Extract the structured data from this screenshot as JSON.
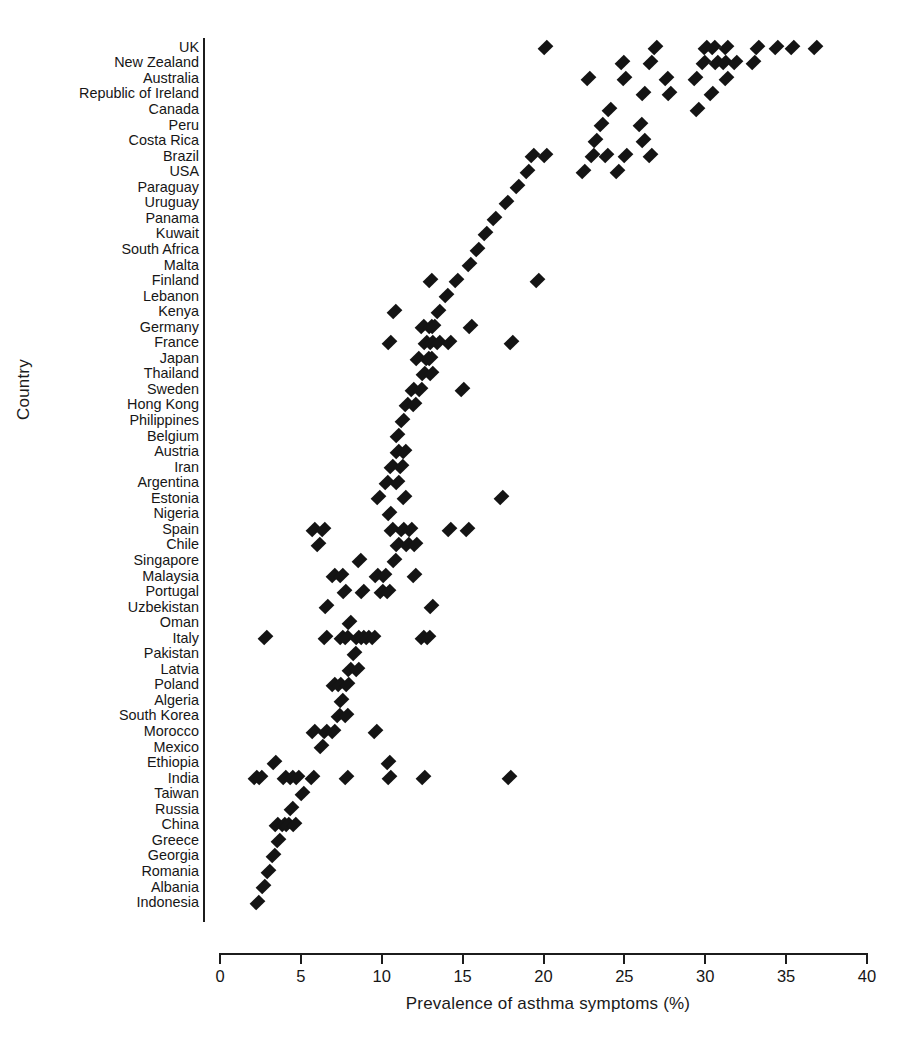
{
  "chart_data": {
    "type": "scatter",
    "title": "",
    "xlabel": "Prevalence of asthma symptoms (%)",
    "ylabel": "Country",
    "xlim": [
      0,
      40
    ],
    "xticks": [
      0,
      5,
      10,
      15,
      20,
      25,
      30,
      35,
      40
    ],
    "grid": false,
    "legend": null,
    "orientation": "horizontal-categorical",
    "marker": "diamond",
    "marker_color": "#141414",
    "categories": [
      "UK",
      "New Zealand",
      "Australia",
      "Republic of Ireland",
      "Canada",
      "Peru",
      "Costa Rica",
      "Brazil",
      "USA",
      "Paraguay",
      "Uruguay",
      "Panama",
      "Kuwait",
      "South Africa",
      "Malta",
      "Finland",
      "Lebanon",
      "Kenya",
      "Germany",
      "France",
      "Japan",
      "Thailand",
      "Sweden",
      "Hong Kong",
      "Philippines",
      "Belgium",
      "Austria",
      "Iran",
      "Argentina",
      "Estonia",
      "Nigeria",
      "Spain",
      "Chile",
      "Singapore",
      "Malaysia",
      "Portugal",
      "Uzbekistan",
      "Oman",
      "Italy",
      "Pakistan",
      "Latvia",
      "Poland",
      "Algeria",
      "South Korea",
      "Morocco",
      "Mexico",
      "Ethiopia",
      "India",
      "Taiwan",
      "Russia",
      "China",
      "Greece",
      "Georgia",
      "Romania",
      "Albania",
      "Indonesia"
    ],
    "series": [
      {
        "name": "Prevalence of asthma symptoms (%)",
        "points_by_category": {
          "UK": [
            20.1,
            26.9,
            30.0,
            30.5,
            31.3,
            33.2,
            34.4,
            35.4,
            36.8
          ],
          "New Zealand": [
            24.9,
            26.6,
            29.9,
            30.7,
            31.2,
            31.9,
            33.0
          ],
          "Australia": [
            22.8,
            25.0,
            27.6,
            29.4,
            31.3
          ],
          "Republic of Ireland": [
            26.2,
            27.8,
            30.4
          ],
          "Canada": [
            24.1,
            29.5
          ],
          "Peru": [
            23.6,
            26.0
          ],
          "Costa Rica": [
            23.2,
            26.2
          ],
          "Brazil": [
            19.3,
            20.1,
            23.0,
            23.9,
            25.1,
            26.6
          ],
          "USA": [
            19.0,
            22.5,
            24.6
          ],
          "Paraguay": [
            18.4
          ],
          "Uruguay": [
            17.7
          ],
          "Panama": [
            17.0
          ],
          "Kuwait": [
            16.4
          ],
          "South Africa": [
            15.9
          ],
          "Malta": [
            15.4
          ],
          "Finland": [
            13.0,
            14.6,
            19.6
          ],
          "Lebanon": [
            14.0
          ],
          "Kenya": [
            10.8,
            13.5
          ],
          "Germany": [
            12.5,
            13.0,
            13.2,
            15.5
          ],
          "France": [
            10.5,
            12.7,
            13.1,
            13.5,
            14.2,
            18.0
          ],
          "Japan": [
            12.2,
            12.8,
            13.0
          ],
          "Thailand": [
            12.6,
            13.1
          ],
          "Sweden": [
            11.9,
            12.4,
            15.0
          ],
          "Hong Kong": [
            11.5,
            12.0
          ],
          "Philippines": [
            11.3
          ],
          "Belgium": [
            11.0
          ],
          "Austria": [
            11.0,
            11.4
          ],
          "Iran": [
            10.6,
            11.2
          ],
          "Argentina": [
            10.3,
            11.0
          ],
          "Estonia": [
            9.8,
            11.4,
            17.4
          ],
          "Nigeria": [
            10.5
          ],
          "Spain": [
            5.8,
            6.4,
            10.6,
            11.3,
            11.8,
            14.2,
            15.3
          ],
          "Chile": [
            6.1,
            11.0,
            11.6,
            12.1
          ],
          "Singapore": [
            8.6,
            10.8
          ],
          "Malaysia": [
            7.0,
            7.5,
            9.7,
            10.2,
            12.0
          ],
          "Portugal": [
            7.7,
            8.8,
            10.0,
            10.4
          ],
          "Uzbekistan": [
            6.6,
            13.1
          ],
          "Oman": [
            8.0
          ],
          "Italy": [
            2.8,
            6.5,
            7.5,
            7.8,
            8.5,
            8.8,
            9.1,
            9.5,
            12.5,
            12.9
          ],
          "Pakistan": [
            8.3
          ],
          "Latvia": [
            8.0,
            8.5
          ],
          "Poland": [
            7.0,
            7.4,
            7.9
          ],
          "Algeria": [
            7.5
          ],
          "South Korea": [
            7.3,
            7.8
          ],
          "Morocco": [
            5.8,
            6.5,
            7.0,
            9.6
          ],
          "Mexico": [
            6.3
          ],
          "Ethiopia": [
            3.4,
            10.4
          ],
          "India": [
            2.2,
            2.5,
            4.0,
            4.4,
            4.8,
            5.7,
            7.8,
            10.5,
            12.6,
            17.9
          ],
          "Taiwan": [
            5.1
          ],
          "Russia": [
            4.4
          ],
          "China": [
            3.5,
            3.9,
            4.2,
            4.6
          ],
          "Greece": [
            3.6
          ],
          "Georgia": [
            3.3
          ],
          "Romania": [
            3.0
          ],
          "Albania": [
            2.7
          ],
          "Indonesia": [
            2.3
          ]
        }
      }
    ]
  },
  "axes": {
    "xlabel": "Prevalence of asthma symptoms (%)",
    "ylabel": "Country",
    "xticklabels": [
      "0",
      "5",
      "10",
      "15",
      "20",
      "25",
      "30",
      "35",
      "40"
    ]
  },
  "caption": ""
}
